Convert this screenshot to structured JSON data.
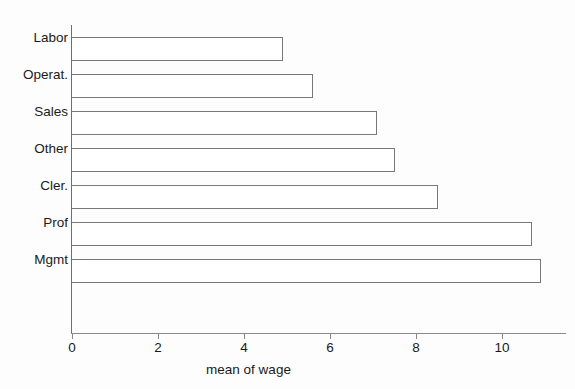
{
  "chart_data": {
    "type": "bar",
    "orientation": "horizontal",
    "title": "",
    "xlabel": "mean of wage",
    "ylabel": "",
    "categories": [
      "Mgmt",
      "Prof",
      "Cler.",
      "Other",
      "Sales",
      "Operat.",
      "Labor"
    ],
    "values": [
      10.9,
      10.7,
      8.5,
      7.5,
      7.1,
      5.6,
      4.9
    ],
    "xlim": [
      0,
      11.5
    ],
    "xticks": [
      0,
      2,
      4,
      6,
      8,
      10
    ],
    "xticklabels": [
      "0",
      "2",
      "4",
      "6",
      "8",
      "10"
    ],
    "grid": false,
    "legend": null,
    "bar_fill_color": "#ffffff",
    "bar_edge_color": "#787878",
    "axis_color": "#8a8a8a",
    "background_color": "#fdfdfd",
    "text_color": "#1a1a1a"
  },
  "categories_top_to_bottom": [
    {
      "label": "Labor",
      "value": 4.9
    },
    {
      "label": "Operat.",
      "value": 5.6
    },
    {
      "label": "Sales",
      "value": 7.1
    },
    {
      "label": "Other",
      "value": 7.5
    },
    {
      "label": "Cler.",
      "value": 8.5
    },
    {
      "label": "Prof",
      "value": 10.7
    },
    {
      "label": "Mgmt",
      "value": 10.9
    }
  ]
}
